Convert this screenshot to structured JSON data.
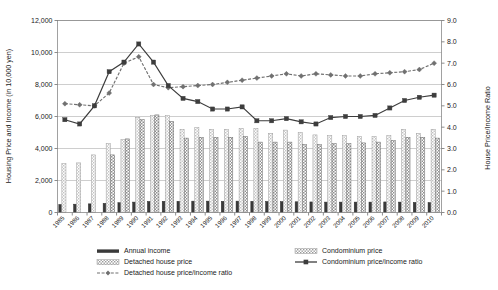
{
  "chart_data": {
    "type": "bar",
    "title": "",
    "xlabel": "",
    "ylabel": "Housing Price and Income (in 10,000 yen)",
    "y2label": "House Price/Income Ratio",
    "ylim": [
      0,
      12000
    ],
    "y2lim": [
      0.0,
      9.0
    ],
    "yticks": [
      "0",
      "2,000",
      "4,000",
      "6,000",
      "8,000",
      "10,000",
      "12,000"
    ],
    "ytick_values": [
      0,
      2000,
      4000,
      6000,
      8000,
      10000,
      12000
    ],
    "y2ticks": [
      "0.0",
      "1.0",
      "2.0",
      "3.0",
      "4.0",
      "5.0",
      "6.0",
      "7.0",
      "8.0",
      "9.0"
    ],
    "y2tick_values": [
      0,
      1,
      2,
      3,
      4,
      5,
      6,
      7,
      8,
      9
    ],
    "grid": true,
    "legend_position": "bottom",
    "categories": [
      "1985",
      "1986",
      "1987",
      "1988",
      "1989",
      "1990",
      "1991",
      "1992",
      "1993",
      "1994",
      "1995",
      "1996",
      "1997",
      "1998",
      "1999",
      "2000",
      "2001",
      "2002",
      "2003",
      "2004",
      "2005",
      "2006",
      "2007",
      "2008",
      "2009",
      "2010"
    ],
    "series": [
      {
        "name": "Annual income",
        "kind": "bar",
        "axis": "left",
        "color": "#404040",
        "values": [
          500,
          520,
          540,
          570,
          610,
          650,
          690,
          700,
          700,
          710,
          710,
          700,
          710,
          700,
          690,
          680,
          670,
          660,
          650,
          650,
          650,
          650,
          660,
          650,
          630,
          620
        ]
      },
      {
        "name": "Detached house price",
        "kind": "bar",
        "axis": "left",
        "color": "#d0d0d0",
        "values": [
          3050,
          3100,
          3600,
          4300,
          4550,
          5950,
          6050,
          6050,
          5200,
          5300,
          5200,
          5200,
          5250,
          5250,
          4950,
          5150,
          5000,
          4850,
          4800,
          4800,
          4750,
          4750,
          4800,
          5200,
          4950,
          5200
        ]
      },
      {
        "name": "Condominium price",
        "kind": "bar",
        "axis": "left",
        "color": "#a8a8a8",
        "values": [
          null,
          null,
          null,
          3600,
          4600,
          5800,
          6100,
          5700,
          4650,
          4700,
          4700,
          4700,
          4750,
          4400,
          4400,
          4400,
          4250,
          4250,
          4300,
          4300,
          4350,
          4400,
          4500,
          4700,
          4700,
          4650
        ]
      },
      {
        "name": "Detached house price/income ratio",
        "kind": "line",
        "axis": "right",
        "color": "#707070",
        "marker": "diamond",
        "dashed": true,
        "values": [
          5.1,
          5.05,
          5.0,
          5.6,
          7.0,
          7.3,
          6.0,
          5.85,
          5.9,
          5.95,
          6.0,
          6.1,
          6.2,
          6.3,
          6.4,
          6.5,
          6.4,
          6.5,
          6.45,
          6.4,
          6.4,
          6.5,
          6.55,
          6.6,
          6.7,
          7.0
        ]
      },
      {
        "name": "Condominium price/income ratio",
        "kind": "line",
        "axis": "right",
        "color": "#3d3d3d",
        "marker": "square",
        "dashed": false,
        "values": [
          4.35,
          4.15,
          5.0,
          6.6,
          7.05,
          7.9,
          7.05,
          5.95,
          5.35,
          5.2,
          4.85,
          4.85,
          4.95,
          4.3,
          4.3,
          4.4,
          4.25,
          4.15,
          4.45,
          4.5,
          4.5,
          4.55,
          4.9,
          5.25,
          5.4,
          5.5
        ]
      }
    ],
    "legend": [
      {
        "label": "Annual income",
        "kind": "bar-solid",
        "color": "#404040"
      },
      {
        "label": "Condominium price",
        "kind": "bar-hatch-light",
        "color": "#bfbfbf"
      },
      {
        "label": "Detached house price",
        "kind": "bar-hatch-light",
        "color": "#bfbfbf"
      },
      {
        "label": "Condominium price/income ratio",
        "kind": "line-square",
        "color": "#3d3d3d"
      },
      {
        "label": "Detached house price/income ratio",
        "kind": "line-diamond-dash",
        "color": "#707070"
      }
    ]
  }
}
